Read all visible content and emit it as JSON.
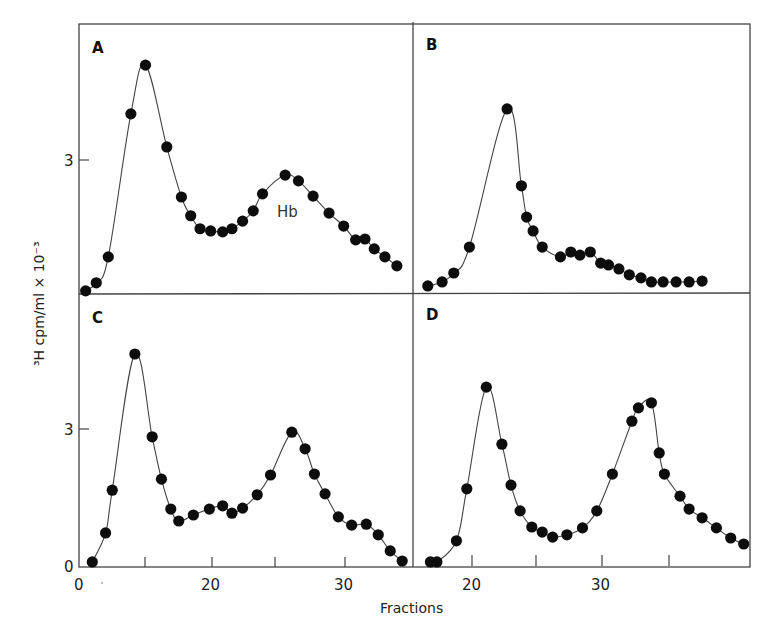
{
  "figure": {
    "y_axis_label": "³H cpm/ml × 10⁻³",
    "x_axis_label": "Fractions",
    "colors": {
      "ink": "#0d0d0d",
      "frame": "#444444",
      "background": "#ffffff"
    }
  },
  "panels": [
    {
      "id": "A",
      "letter": "A",
      "y_tick_labels": [
        "3"
      ],
      "annotation": "Hb"
    },
    {
      "id": "B",
      "letter": "B"
    },
    {
      "id": "C",
      "letter": "C",
      "y_tick_labels": [
        "0",
        "3"
      ],
      "x_tick_labels": [
        "0",
        "20",
        "30"
      ]
    },
    {
      "id": "D",
      "letter": "D",
      "x_tick_labels": [
        "20",
        "30"
      ]
    }
  ],
  "chart_data": [
    {
      "type": "line",
      "panel": "A",
      "title": "A",
      "xlabel": "Fractions",
      "ylabel": "3H cpm/ml x 10^-3",
      "annotations": [
        {
          "text": "Hb",
          "x": 25.5,
          "y": 1.4
        }
      ],
      "ylim": [
        0,
        5.2
      ],
      "x": [
        10.5,
        11.3,
        12.2,
        13.9,
        15.0,
        16.6,
        17.7,
        18.4,
        19.1,
        19.9,
        20.8,
        21.5,
        22.3,
        23.1,
        23.8,
        25.5,
        26.5,
        27.6,
        28.8,
        29.9,
        30.8,
        31.5,
        32.2,
        33.0,
        33.9
      ],
      "y": [
        0.07,
        0.25,
        0.83,
        4.03,
        5.12,
        3.29,
        2.17,
        1.75,
        1.46,
        1.41,
        1.39,
        1.46,
        1.63,
        1.86,
        2.24,
        2.66,
        2.53,
        2.19,
        1.81,
        1.52,
        1.21,
        1.23,
        1.01,
        0.83,
        0.63
      ]
    },
    {
      "type": "line",
      "panel": "B",
      "title": "B",
      "xlabel": "Fractions",
      "ylabel": "3H cpm/ml x 10^-3",
      "ylim": [
        0,
        5.2
      ],
      "x": [
        16.6,
        17.7,
        18.6,
        19.8,
        22.7,
        23.8,
        24.2,
        24.7,
        25.4,
        26.8,
        27.6,
        28.3,
        29.1,
        29.9,
        30.5,
        31.3,
        32.1,
        33.0,
        33.8,
        34.7,
        35.7,
        36.7,
        37.7
      ],
      "y": [
        0.18,
        0.27,
        0.47,
        1.05,
        4.14,
        2.42,
        1.72,
        1.41,
        1.05,
        0.83,
        0.94,
        0.87,
        0.94,
        0.69,
        0.65,
        0.56,
        0.43,
        0.36,
        0.27,
        0.27,
        0.27,
        0.27,
        0.29
      ]
    },
    {
      "type": "line",
      "panel": "C",
      "title": "C",
      "xlabel": "Fractions",
      "ylabel": "3H cpm/ml x 10^-3",
      "x_ticks": [
        0,
        20,
        30
      ],
      "y_ticks": [
        0,
        3
      ],
      "ylim": [
        0,
        5.2
      ],
      "x": [
        11.0,
        12.0,
        12.5,
        14.2,
        15.5,
        16.2,
        16.9,
        17.5,
        18.6,
        19.8,
        20.8,
        21.5,
        22.3,
        23.4,
        24.4,
        26.0,
        27.0,
        27.7,
        28.5,
        29.5,
        30.5,
        31.6,
        32.5,
        33.4,
        34.3
      ],
      "y": [
        0.11,
        0.74,
        1.67,
        4.63,
        2.83,
        1.91,
        1.26,
        1.0,
        1.13,
        1.26,
        1.33,
        1.17,
        1.28,
        1.57,
        2.0,
        2.93,
        2.57,
        2.02,
        1.59,
        1.09,
        0.91,
        0.93,
        0.7,
        0.35,
        0.13
      ]
    },
    {
      "type": "line",
      "panel": "D",
      "title": "D",
      "xlabel": "Fractions",
      "ylabel": "3H cpm/ml x 10^-3",
      "x_ticks": [
        20,
        30
      ],
      "ylim": [
        0,
        5.2
      ],
      "x": [
        16.8,
        17.3,
        18.8,
        19.6,
        21.1,
        22.3,
        23.0,
        23.7,
        24.6,
        25.4,
        26.2,
        27.3,
        28.5,
        29.6,
        30.8,
        32.3,
        32.8,
        33.8,
        34.4,
        34.8,
        36.0,
        36.7,
        37.7,
        38.8,
        39.9,
        40.9
      ],
      "y": [
        0.11,
        0.11,
        0.57,
        1.7,
        3.91,
        2.67,
        1.78,
        1.22,
        0.87,
        0.76,
        0.65,
        0.7,
        0.85,
        1.22,
        2.02,
        3.17,
        3.46,
        3.57,
        2.48,
        2.02,
        1.54,
        1.26,
        1.07,
        0.85,
        0.63,
        0.5
      ]
    }
  ]
}
